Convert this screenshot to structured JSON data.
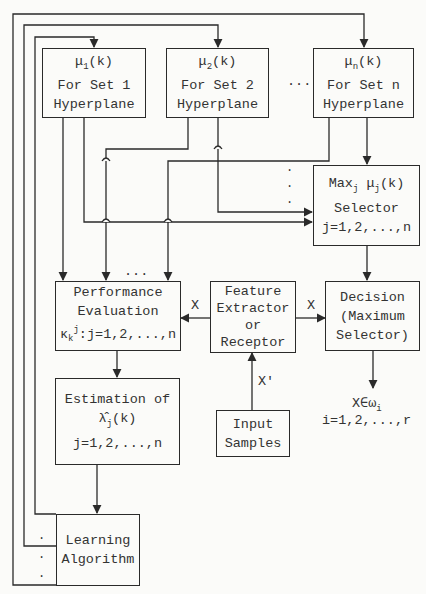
{
  "diagram": {
    "type": "block-diagram",
    "blocks": {
      "set1": {
        "line1_main": "μ",
        "line1_sub": "1",
        "line1_tail": "(k)",
        "line2": "For Set 1",
        "line3": "Hyperplane"
      },
      "set2": {
        "line1_main": "μ",
        "line1_sub": "2",
        "line1_tail": "(k)",
        "line2": "For Set 2",
        "line3": "Hyperplane"
      },
      "setn": {
        "line1_main": "μ",
        "line1_sub": "n",
        "line1_tail": "(k)",
        "line2": "For Set n",
        "line3": "Hyperplane"
      },
      "selector": {
        "line1_a": "Max",
        "line1_sub1": "j",
        "line1_b": " μ",
        "line1_sub2": "j",
        "line1_tail": "(k)",
        "line2": "Selector",
        "line3": "j=1,2,...,n"
      },
      "performance": {
        "line1": "Performance",
        "line2": "Evaluation",
        "line3_main": "κ",
        "line3_sub": "k",
        "line3_sup": "j",
        "line3_tail": ":j=1,2,...,n"
      },
      "feature": {
        "line1": "Feature",
        "line2": "Extractor",
        "line3": "or",
        "line4": "Receptor"
      },
      "decision": {
        "line1": "Decision",
        "line2": "(Maximum",
        "line3": "Selector)"
      },
      "estimation": {
        "line1": "Estimation of",
        "line2_main": "λ̂",
        "line2_sub": "j",
        "line2_tail": "(k)",
        "line3": "j=1,2,...,n"
      },
      "input": {
        "line1": "Input",
        "line2": "Samples"
      },
      "learning": {
        "line1": "Learning",
        "line2": "Algorithm"
      }
    },
    "labels": {
      "x_left": "X",
      "x_right": "X",
      "x_prime": "X'",
      "output_main": "X∈ω",
      "output_sub": "i",
      "output_range": "i=1,2,...,r",
      "ellipsis_top": "...",
      "ellipsis_mid": "...",
      "vdots": "⋮"
    },
    "line_color": "#2a2a2a"
  }
}
